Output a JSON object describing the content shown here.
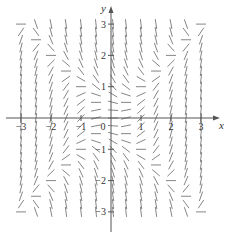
{
  "chart_data": {
    "type": "slope_field",
    "title": "",
    "equation_inferred": "dy/dx = x^2 - y^2",
    "xlabel": "x",
    "ylabel": "y",
    "xlim": [
      -3,
      3
    ],
    "ylim": [
      -3,
      3
    ],
    "x_ticks": [
      -3,
      -2,
      -1,
      0,
      1,
      2,
      3
    ],
    "x_tick_labels": [
      "−3",
      "−2",
      "−1",
      "0",
      "1",
      "2",
      "3"
    ],
    "y_ticks": [
      -3,
      -2,
      -1,
      1,
      2,
      3
    ],
    "y_tick_labels": [
      "−3",
      "−2",
      "−1",
      "1",
      "2",
      "3"
    ],
    "grid": false,
    "sample_step_x": 0.5,
    "sample_step_y": 0.25
  },
  "colors": {
    "axis": "#555555",
    "segment": "#777777",
    "text": "#333333"
  }
}
